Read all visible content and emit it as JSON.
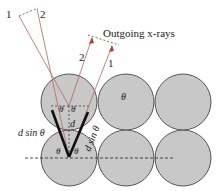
{
  "title": "Outgoing x-rays",
  "incoming_ray_labels": [
    "1",
    "2"
  ],
  "outgoing_ray_labels": [
    "2",
    "1"
  ],
  "angle_symbol": "θ",
  "spacing_label": "d",
  "path_diff_left": "d sin θ",
  "path_diff_right": "d sin θ",
  "colors": {
    "atom_fill": "#c8c8c8",
    "atom_stroke": "#555555",
    "ray": "#b5655a",
    "arrow": "#c0392b",
    "v_lines": "#111111"
  }
}
